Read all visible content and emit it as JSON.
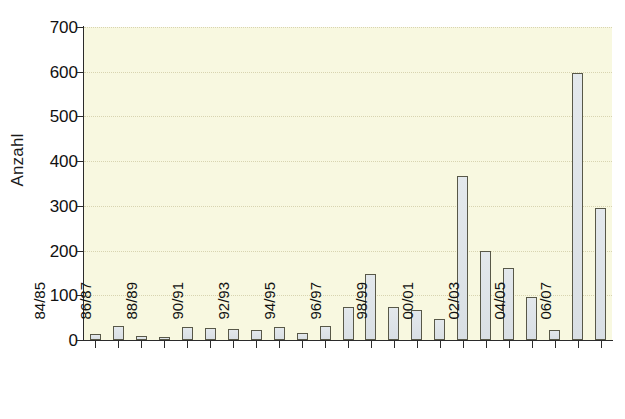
{
  "chart_data": {
    "type": "bar",
    "title": "",
    "subtitle": "",
    "xlabel": "",
    "ylabel": "Anzahl",
    "ylim": [
      0,
      700
    ],
    "ytick_step": 100,
    "yticks": [
      0,
      100,
      200,
      300,
      400,
      500,
      600,
      700
    ],
    "ytick_labels": [
      "0",
      "100",
      "200",
      "300",
      "400",
      "500",
      "600",
      "700"
    ],
    "grid": true,
    "grid_axis": "y",
    "legend": false,
    "legend_position": "none",
    "categories": [
      "84/85",
      "85/86",
      "86/87",
      "87/88",
      "88/89",
      "89/90",
      "90/91",
      "91/92",
      "92/93",
      "93/94",
      "94/95",
      "95/96",
      "96/97",
      "97/98",
      "98/99",
      "99/00",
      "00/01",
      "01/02",
      "02/03",
      "03/04",
      "04/05",
      "05/06",
      "06/07"
    ],
    "xtick_labels_shown": [
      "84/85",
      "",
      "86/87",
      "",
      "88/89",
      "",
      "90/91",
      "",
      "92/93",
      "",
      "94/95",
      "",
      "96/97",
      "",
      "98/99",
      "",
      "00/01",
      "",
      "02/03",
      "",
      "04/05",
      "",
      "06/07"
    ],
    "values": [
      14,
      32,
      8,
      6,
      28,
      26,
      24,
      22,
      29,
      15,
      32,
      73,
      148,
      73,
      68,
      48,
      366,
      198,
      162,
      97,
      22,
      597,
      295
    ],
    "series": [
      {
        "name": "Anzahl",
        "values": [
          14,
          32,
          8,
          6,
          28,
          26,
          24,
          22,
          29,
          15,
          32,
          73,
          148,
          73,
          68,
          48,
          366,
          198,
          162,
          97,
          22,
          597,
          295
        ]
      }
    ],
    "colors": {
      "plot_background": "#f8f8e0",
      "bar_fill": "#dfe4e8",
      "bar_border": "#585848",
      "gridline": "#d8d4b0",
      "axis": "#2b2b2b",
      "text": "#111111",
      "page_background": "#ffffff"
    }
  }
}
